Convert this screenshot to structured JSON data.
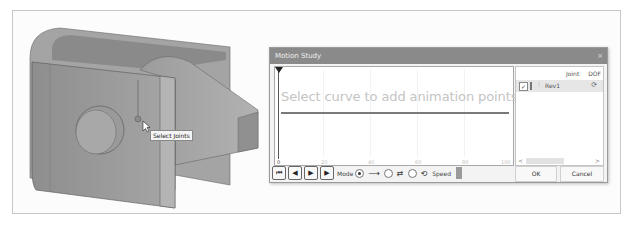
{
  "viewport": {
    "tooltip": "Select Joints"
  },
  "dialog": {
    "title": "Motion Study",
    "close_icon": "×",
    "timeline": {
      "hint": "Select curve to add animation points",
      "ticks": [
        "0",
        "20",
        "40",
        "60",
        "80",
        "100"
      ]
    },
    "joints_panel": {
      "headers": {
        "joint": "Joint",
        "dof": "DOF"
      },
      "rows": [
        {
          "checked": true,
          "name": "Rev1",
          "dof_icon": "rotate-icon"
        }
      ],
      "scroll_left": "<",
      "scroll_right": ">"
    },
    "controls": {
      "go_start": "⏮",
      "step_back": "◀",
      "step_forward": "▶",
      "play": "▶",
      "mode_label": "Mode",
      "mode_options": [
        {
          "glyph": "⟶",
          "selected": true
        },
        {
          "glyph": "⇄",
          "selected": false
        },
        {
          "glyph": "⟲",
          "selected": false
        }
      ],
      "speed_label": "Speed"
    },
    "ok_label": "OK",
    "cancel_label": "Cancel"
  }
}
